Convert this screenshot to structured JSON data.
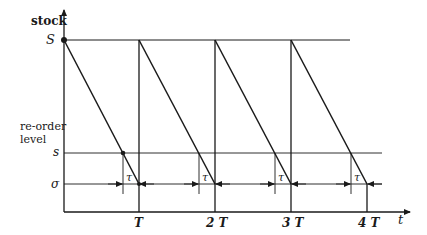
{
  "diagram": {
    "title": "",
    "y_axis_label": "stock",
    "x_axis_label": "t",
    "level_labels": {
      "max": "S",
      "reorder_title_line1": "re-order",
      "reorder_title_line2": "level",
      "reorder": "s",
      "safety": "σ"
    },
    "lead_time_label": "τ",
    "period_labels": [
      "T",
      "2 T",
      "3 T",
      "4 T"
    ],
    "cycles": 4,
    "colors": {
      "line": "#1a1a1a",
      "background": "#ffffff"
    }
  }
}
